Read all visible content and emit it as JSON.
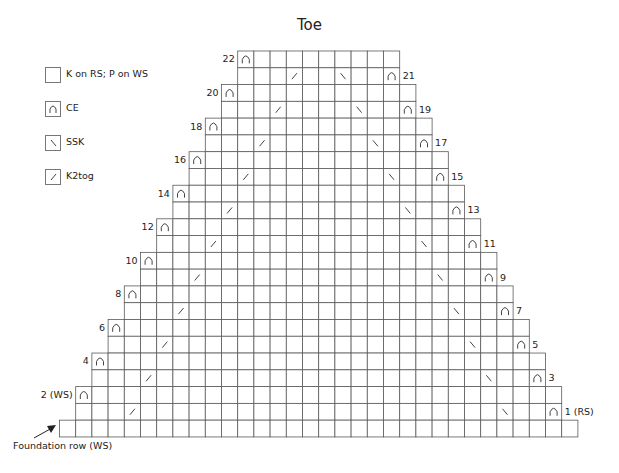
{
  "title": "Toe",
  "legend": [
    {
      "symbol": "blank",
      "label": "K on RS; P on WS"
    },
    {
      "symbol": "ce",
      "label": "CE"
    },
    {
      "symbol": "ssk",
      "label": "SSK"
    },
    {
      "symbol": "k2tog",
      "label": "K2tog"
    }
  ],
  "chart_data": {
    "type": "table",
    "title": "Toe",
    "foundation": {
      "label": "Foundation row (WS)",
      "stitches": 32
    },
    "rows": [
      {
        "row": 22,
        "label": "22",
        "side": "left",
        "stitches": 10,
        "ce": [
          0
        ],
        "k2tog": [],
        "ssk": []
      },
      {
        "row": 21,
        "label": "21",
        "side": "right",
        "stitches": 10,
        "ce": [
          9
        ],
        "k2tog": [
          3
        ],
        "ssk": [
          6
        ]
      },
      {
        "row": 20,
        "label": "20",
        "side": "left",
        "stitches": 12,
        "ce": [
          0
        ],
        "k2tog": [],
        "ssk": []
      },
      {
        "row": 19,
        "label": "19",
        "side": "right",
        "stitches": 12,
        "ce": [
          11
        ],
        "k2tog": [
          3
        ],
        "ssk": [
          8
        ]
      },
      {
        "row": 18,
        "label": "18",
        "side": "left",
        "stitches": 14,
        "ce": [
          0
        ],
        "k2tog": [],
        "ssk": []
      },
      {
        "row": 17,
        "label": "17",
        "side": "right",
        "stitches": 14,
        "ce": [
          13
        ],
        "k2tog": [
          3
        ],
        "ssk": [
          10
        ]
      },
      {
        "row": 16,
        "label": "16",
        "side": "left",
        "stitches": 16,
        "ce": [
          0
        ],
        "k2tog": [],
        "ssk": []
      },
      {
        "row": 15,
        "label": "15",
        "side": "right",
        "stitches": 16,
        "ce": [
          15
        ],
        "k2tog": [
          3
        ],
        "ssk": [
          12
        ]
      },
      {
        "row": 14,
        "label": "14",
        "side": "left",
        "stitches": 18,
        "ce": [
          0
        ],
        "k2tog": [],
        "ssk": []
      },
      {
        "row": 13,
        "label": "13",
        "side": "right",
        "stitches": 18,
        "ce": [
          17
        ],
        "k2tog": [
          3
        ],
        "ssk": [
          14
        ]
      },
      {
        "row": 12,
        "label": "12",
        "side": "left",
        "stitches": 20,
        "ce": [
          0
        ],
        "k2tog": [],
        "ssk": []
      },
      {
        "row": 11,
        "label": "11",
        "side": "right",
        "stitches": 20,
        "ce": [
          19
        ],
        "k2tog": [
          3
        ],
        "ssk": [
          16
        ]
      },
      {
        "row": 10,
        "label": "10",
        "side": "left",
        "stitches": 22,
        "ce": [
          0
        ],
        "k2tog": [],
        "ssk": []
      },
      {
        "row": 9,
        "label": "9",
        "side": "right",
        "stitches": 22,
        "ce": [
          21
        ],
        "k2tog": [
          3
        ],
        "ssk": [
          18
        ]
      },
      {
        "row": 8,
        "label": "8",
        "side": "left",
        "stitches": 24,
        "ce": [
          0
        ],
        "k2tog": [],
        "ssk": []
      },
      {
        "row": 7,
        "label": "7",
        "side": "right",
        "stitches": 24,
        "ce": [
          23
        ],
        "k2tog": [
          3
        ],
        "ssk": [
          20
        ]
      },
      {
        "row": 6,
        "label": "6",
        "side": "left",
        "stitches": 26,
        "ce": [
          0
        ],
        "k2tog": [],
        "ssk": []
      },
      {
        "row": 5,
        "label": "5",
        "side": "right",
        "stitches": 26,
        "ce": [
          25
        ],
        "k2tog": [
          3
        ],
        "ssk": [
          22
        ]
      },
      {
        "row": 4,
        "label": "4",
        "side": "left",
        "stitches": 28,
        "ce": [
          0
        ],
        "k2tog": [],
        "ssk": []
      },
      {
        "row": 3,
        "label": "3",
        "side": "right",
        "stitches": 28,
        "ce": [
          27
        ],
        "k2tog": [
          3
        ],
        "ssk": [
          24
        ]
      },
      {
        "row": 2,
        "label": "2 (WS)",
        "side": "left",
        "stitches": 30,
        "ce": [
          0
        ],
        "k2tog": [],
        "ssk": []
      },
      {
        "row": 1,
        "label": "1 (RS)",
        "side": "right",
        "stitches": 30,
        "ce": [
          29
        ],
        "k2tog": [
          3
        ],
        "ssk": [
          26
        ]
      }
    ]
  },
  "colors": {
    "grid": "#5a5a5a",
    "symbol": "#444444",
    "text": "#222222"
  }
}
